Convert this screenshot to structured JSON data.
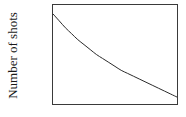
{
  "figure": {
    "background_color": "#ffffff",
    "frame_color": "#3a3a3a",
    "curve_color": "#2b2b2b"
  },
  "chart_data": {
    "type": "line",
    "title": "",
    "xlabel": "",
    "ylabel": "Number of shots",
    "xlim": [
      0,
      100
    ],
    "ylim": [
      0,
      100
    ],
    "grid": false,
    "legend": null,
    "xticks": [],
    "yticks": [],
    "xticklabels": [],
    "yticklabels": [],
    "annotations": [],
    "series": [
      {
        "name": "Number of shots",
        "description": "Monotonically decreasing convex decay curve, steep at first then flattening toward the right edge",
        "x": [
          0,
          5,
          10,
          15,
          20,
          25,
          30,
          35,
          40,
          45,
          50,
          55,
          60,
          65,
          70,
          75,
          80,
          85,
          90,
          95,
          100
        ],
        "y": [
          91,
          84,
          77,
          71,
          65,
          60,
          55,
          50,
          46,
          42,
          38,
          34,
          31,
          28,
          25,
          22,
          19,
          16,
          13,
          10,
          7
        ]
      }
    ]
  }
}
